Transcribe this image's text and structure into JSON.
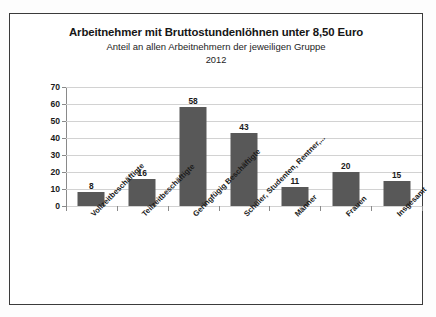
{
  "chart_data": {
    "type": "bar",
    "title": "Arbeitnehmer mit Bruttostundenlöhnen unter 8,50 Euro",
    "subtitle": "Anteil an allen Arbeitnehmern der jeweiligen Gruppe",
    "year": "2012",
    "xlabel": "",
    "ylabel": "",
    "ylim": [
      0,
      70
    ],
    "yticks": [
      70,
      60,
      50,
      40,
      30,
      20,
      10,
      0
    ],
    "grid": true,
    "legend": false,
    "bar_color": "#585858",
    "categories": [
      "Vollzeitbeschäftigte",
      "Teilzeitbeschäftigte",
      "Geringfügig Beschäftigte",
      "Schüler, Studenten, Rentner,...",
      "Männer",
      "Frauen",
      "Insgesamt"
    ],
    "values": [
      8,
      16,
      58,
      43,
      11,
      20,
      15
    ],
    "value_labels": [
      "8",
      "16",
      "58",
      "43",
      "11",
      "20",
      "15"
    ]
  }
}
